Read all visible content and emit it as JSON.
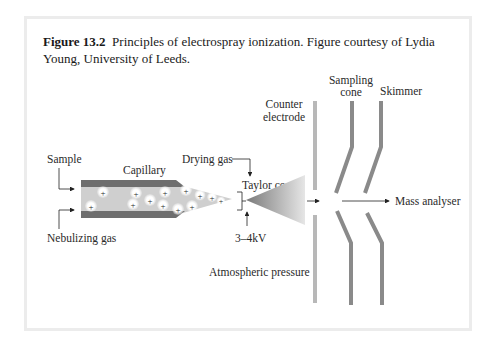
{
  "caption": {
    "label": "Figure 13.2",
    "text": "Principles of electrospray ionization. Figure courtesy of Lydia Young, University of Leeds."
  },
  "diagram": {
    "labels": {
      "sample": "Sample",
      "capillary": "Capillary",
      "nebulizing_gas": "Nebulizing gas",
      "drying_gas": "Drying gas",
      "taylor_cone": "Taylor cone",
      "voltage": "3–4kV",
      "atmospheric_pressure": "Atmospheric pressure",
      "counter_electrode_line1": "Counter",
      "counter_electrode_line2": "electrode",
      "sampling_cone_line1": "Sampling",
      "sampling_cone_line2": "cone",
      "skimmer": "Skimmer",
      "mass_analyser": "Mass analyser"
    },
    "ion_symbol": "+",
    "colors": {
      "capillary_wall": "#6e6e6e",
      "capillary_fill": "#cfcfcf",
      "cone_plates": "#8a8a8a",
      "counter_electrode": "#b8b8b8",
      "frame_border": "#ececec"
    }
  }
}
